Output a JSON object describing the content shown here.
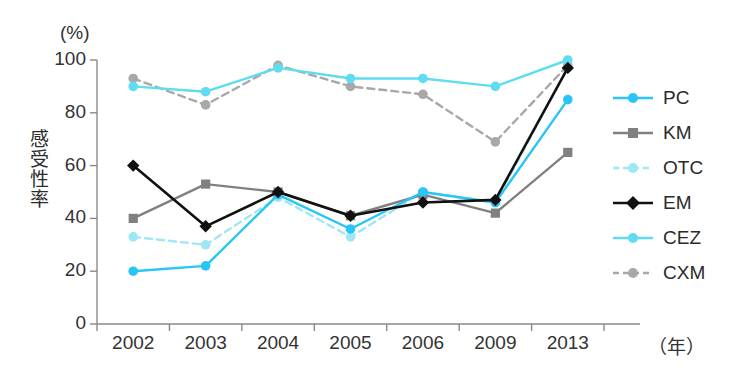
{
  "figure": {
    "y_axis_unit": "(%)",
    "y_axis_label_chars": [
      "感",
      "受",
      "性",
      "率"
    ],
    "x_axis_unit": "（年）"
  },
  "chart_data": {
    "type": "line",
    "title": "",
    "xlabel": "（年）",
    "ylabel": "感受性率",
    "y_unit": "(%)",
    "categories": [
      "2002",
      "2003",
      "2004",
      "2005",
      "2006",
      "2009",
      "2013"
    ],
    "x_tick_labels": [
      "2002",
      "2003",
      "2004",
      "2005",
      "2006",
      "2009",
      "2013"
    ],
    "y_tick_labels": [
      "0",
      "20",
      "40",
      "60",
      "80",
      "100"
    ],
    "y_ticks": [
      0,
      20,
      40,
      60,
      80,
      100
    ],
    "ylim": [
      0,
      100
    ],
    "grid": false,
    "legend_position": "right",
    "series": [
      {
        "name": "PC",
        "color": "#29c5f6",
        "marker": "circle",
        "line_style": "solid",
        "values": [
          20,
          22,
          49,
          36,
          50,
          46,
          85
        ]
      },
      {
        "name": "KM",
        "color": "#808080",
        "marker": "square",
        "line_style": "solid",
        "values": [
          40,
          53,
          50,
          41,
          49,
          42,
          65
        ]
      },
      {
        "name": "OTC",
        "color": "#9fe7f5",
        "marker": "circle",
        "line_style": "dashed",
        "values": [
          33,
          30,
          48,
          33,
          50,
          46,
          97
        ]
      },
      {
        "name": "EM",
        "color": "#111111",
        "marker": "diamond",
        "line_style": "solid",
        "values": [
          60,
          37,
          50,
          41,
          46,
          47,
          97
        ]
      },
      {
        "name": "CEZ",
        "color": "#5fdcf0",
        "marker": "circle",
        "line_style": "solid",
        "values": [
          90,
          88,
          97,
          93,
          93,
          90,
          100
        ]
      },
      {
        "name": "CXM",
        "color": "#a8a8a8",
        "marker": "circle",
        "line_style": "dashed",
        "values": [
          93,
          83,
          98,
          90,
          87,
          69,
          98
        ]
      }
    ]
  },
  "legend": {
    "items": [
      {
        "label": "PC"
      },
      {
        "label": "KM"
      },
      {
        "label": "OTC"
      },
      {
        "label": "EM"
      },
      {
        "label": "CEZ"
      },
      {
        "label": "CXM"
      }
    ]
  }
}
